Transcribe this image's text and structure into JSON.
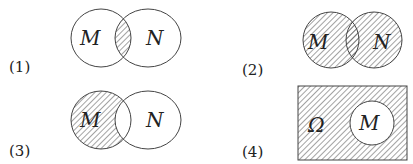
{
  "diagrams": [
    {
      "label": "(1)",
      "sets": [
        "M",
        "N"
      ],
      "shaded": "intersection of M and N"
    },
    {
      "label": "(2)",
      "sets": [
        "M",
        "N"
      ],
      "shaded": "union of M and N"
    },
    {
      "label": "(3)",
      "sets": [
        "M",
        "N"
      ],
      "shaded": "M minus N"
    },
    {
      "label": "(4)",
      "sets": [
        "Ω",
        "M"
      ],
      "shaded": "complement of M in Ω"
    }
  ],
  "colors": {
    "stroke": "#444444",
    "hatch": "#555555",
    "background": "#ffffff"
  }
}
